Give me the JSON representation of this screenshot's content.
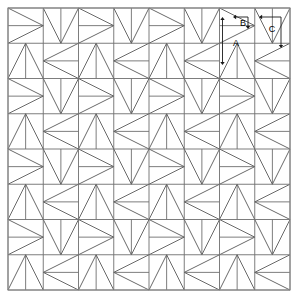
{
  "diagram": {
    "canvas": {
      "width": 293,
      "height": 305
    },
    "layout": {
      "origin_x": 8,
      "origin_y": 8,
      "block_size": 70.5,
      "blocks_across": 4,
      "blocks_down": 4,
      "quadrant_size": 35.25
    },
    "colors": {
      "background": "#ffffff",
      "grid_stroke": "#6e6e6e",
      "diagonal_stroke": "#585858",
      "border_stroke": "#8a8a8a",
      "dimension_stroke": "#1a1a1a",
      "label_text": "#000000"
    },
    "dimensions": [
      {
        "id": "A",
        "label": "A",
        "type": "double-headed-vertical-arrow",
        "label_x": 236,
        "label_y": 44,
        "line_x": 222.5,
        "line_y1": 17,
        "line_y2": 65
      },
      {
        "id": "B",
        "label": "B",
        "type": "elbow-arrow-left-and-down",
        "label_x": 243,
        "label_y": 24,
        "corner_x": 248,
        "corner_y": 17,
        "arrow_left_x": 233,
        "arrow_down_y": 29
      },
      {
        "id": "C",
        "label": "C",
        "type": "elbow-arrow-left-and-down",
        "label_x": 272,
        "label_y": 30,
        "corner_x": 281,
        "corner_y": 17,
        "arrow_left_x": 259,
        "arrow_down_y": 48
      }
    ]
  }
}
